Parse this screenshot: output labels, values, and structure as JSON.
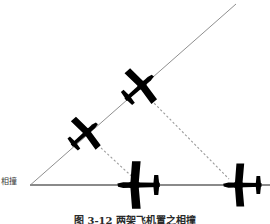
{
  "figure": {
    "label_collision": "相撞",
    "caption": "图 3-12  两架飞机置之相撞",
    "colors": {
      "aircraft_fill": "#000000",
      "line_solid": "#8a8a8a",
      "line_dashed": "#9a9a9a",
      "background": "#ffffff",
      "text": "#3d3d3d"
    },
    "geometry": {
      "vertex": {
        "x": 30,
        "y": 185
      },
      "horizontal_line": {
        "x1": 30,
        "y1": 185,
        "x2": 270,
        "y2": 185
      },
      "diagonal_line": {
        "x1": 30,
        "y1": 185,
        "x2": 236,
        "y2": 4
      },
      "dashed_sightlines": [
        {
          "x1": 88,
          "y1": 136,
          "x2": 139,
          "y2": 183
        },
        {
          "x1": 148,
          "y1": 97,
          "x2": 228,
          "y2": 178
        }
      ]
    },
    "aircraft": [
      {
        "name": "aircraft-upper-diagonal",
        "x": 141,
        "y": 86,
        "rotation": -41,
        "scale": 1.0
      },
      {
        "name": "aircraft-lower-diagonal",
        "x": 86,
        "y": 133,
        "rotation": -41,
        "scale": 0.92
      },
      {
        "name": "aircraft-bottom-center",
        "x": 136,
        "y": 185,
        "rotation": -90,
        "scale": 1.18
      },
      {
        "name": "aircraft-bottom-right",
        "x": 240,
        "y": 185,
        "rotation": -90,
        "scale": 1.05
      }
    ]
  }
}
